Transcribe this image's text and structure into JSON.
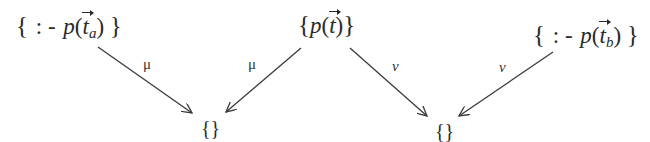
{
  "diagram": {
    "type": "span-of-substitutions",
    "stroke_color": "#3a3a3a",
    "text_color": "#2a2a2a",
    "nodes": [
      {
        "id": "left-clause",
        "open": "{",
        "op": ": -",
        "pred": "p",
        "lparen": "(",
        "var": "t",
        "sub": "a",
        "rparen": ")",
        "close": "}",
        "text": "{ : - p(t⃗_a) }"
      },
      {
        "id": "center-clause",
        "open": "{",
        "pred": "p",
        "lparen": "(",
        "var": "t",
        "rparen": ")",
        "close": "}",
        "text": "{ p(t⃗) }"
      },
      {
        "id": "right-clause",
        "open": "{",
        "op": ": -",
        "pred": "p",
        "lparen": "(",
        "var": "t",
        "sub": "b",
        "rparen": ")",
        "close": "}",
        "text": "{ : - p(t⃗_b) }"
      },
      {
        "id": "empty-clause-1",
        "text": "{}"
      },
      {
        "id": "empty-clause-2",
        "text": "{}"
      }
    ],
    "edges": [
      {
        "from": "left-clause",
        "to": "empty-clause-1",
        "label": "μ"
      },
      {
        "from": "center-clause",
        "to": "empty-clause-1",
        "label": "μ"
      },
      {
        "from": "center-clause",
        "to": "empty-clause-2",
        "label": "ν"
      },
      {
        "from": "right-clause",
        "to": "empty-clause-2",
        "label": "ν"
      }
    ]
  }
}
